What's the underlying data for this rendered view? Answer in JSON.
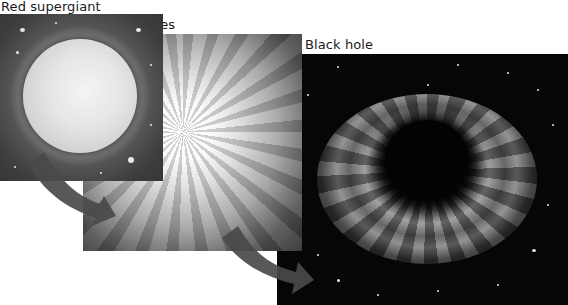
{
  "diagram": {
    "stages": [
      {
        "id": "red-supergiant",
        "label": "Red supergiant"
      },
      {
        "id": "star-implodes",
        "label": "Star implodes"
      },
      {
        "id": "black-hole",
        "label": "Black hole"
      }
    ],
    "arrows": [
      {
        "from": "red-supergiant",
        "to": "star-implodes",
        "icon": "curved-arrow-icon"
      },
      {
        "from": "star-implodes",
        "to": "black-hole",
        "icon": "curved-arrow-icon"
      }
    ],
    "colors": {
      "background": "#ffffff",
      "label_text": "#1a1a1a",
      "arrow": "#4a4a4a",
      "space": "#060606"
    }
  }
}
